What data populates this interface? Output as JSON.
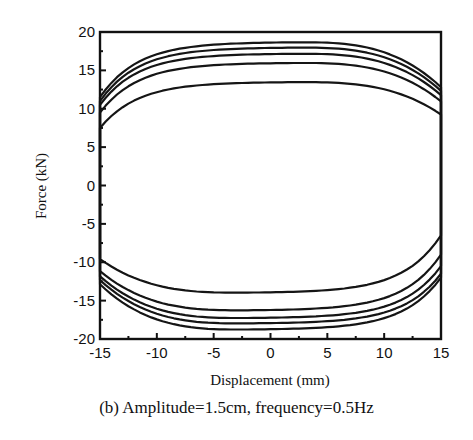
{
  "chart_data": {
    "type": "line",
    "title": "",
    "caption": "(b) Amplitude=1.5cm, frequency=0.5Hz",
    "xlabel": "Displacement (mm)",
    "ylabel": "Force (kN)",
    "xlim": [
      -15,
      15
    ],
    "ylim": [
      -20,
      20
    ],
    "xticks": [
      -15,
      -10,
      -5,
      0,
      5,
      10,
      15
    ],
    "yticks": [
      20,
      15,
      10,
      5,
      0,
      -5,
      -10,
      -15,
      -20
    ],
    "grid": false,
    "legend": null,
    "series": [
      {
        "name": "loop 1",
        "upper_peak_kN": 13.5,
        "lower_peak_kN": -14.0,
        "upper_at_left_edge_kN": 7.5,
        "lower_at_right_edge_kN": -6.5
      },
      {
        "name": "loop 2",
        "upper_peak_kN": 16.0,
        "lower_peak_kN": -16.3,
        "upper_at_left_edge_kN": 9.5,
        "lower_at_right_edge_kN": -9.0
      },
      {
        "name": "loop 3",
        "upper_peak_kN": 17.2,
        "lower_peak_kN": -17.3,
        "upper_at_left_edge_kN": 10.5,
        "lower_at_right_edge_kN": -10.5
      },
      {
        "name": "loop 4",
        "upper_peak_kN": 18.0,
        "lower_peak_kN": -18.0,
        "upper_at_left_edge_kN": 11.0,
        "lower_at_right_edge_kN": -11.5
      },
      {
        "name": "loop 5",
        "upper_peak_kN": 18.7,
        "lower_peak_kN": -18.8,
        "upper_at_left_edge_kN": 11.5,
        "lower_at_right_edge_kN": -12.0
      }
    ],
    "sample_points": {
      "x": [
        -15,
        -14,
        -12.5,
        -10,
        -5,
        0,
        2,
        5,
        10,
        12.5,
        14,
        15
      ],
      "loop1_upper": [
        7.5,
        8.8,
        10.2,
        11.6,
        12.9,
        13.4,
        13.5,
        13.2,
        12.0,
        10.6,
        8.8,
        4
      ],
      "loop5_upper": [
        11.5,
        14.0,
        15.5,
        16.8,
        18.0,
        18.6,
        18.7,
        18.4,
        17.2,
        16.0,
        14.2,
        8
      ],
      "loop1_lower": [
        -6.5,
        -8.6,
        -10.2,
        -11.8,
        -13.3,
        -13.9,
        -14.0,
        -13.8,
        -12.5,
        -11.3,
        -9.5,
        -6.5
      ],
      "loop5_lower": [
        -12.0,
        -13.8,
        -15.3,
        -16.8,
        -18.1,
        -18.7,
        -18.8,
        -18.5,
        -17.4,
        -16.2,
        -14.5,
        -11
      ]
    }
  }
}
